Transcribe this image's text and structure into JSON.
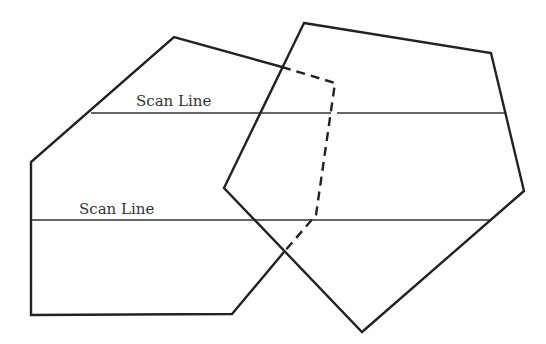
{
  "diagram": {
    "type": "scan-line polygon visibility",
    "labels": {
      "upper_scan_line": "Scan Line",
      "lower_scan_line": "Scan Line"
    },
    "colors": {
      "stroke": "#222222",
      "scan_line": "#333333",
      "background": "#ffffff"
    },
    "polygons": {
      "left_polygon": {
        "visible_vertices": [
          [
            282,
            67
          ],
          [
            174,
            37
          ],
          [
            31,
            162
          ],
          [
            31,
            315
          ],
          [
            232,
            314
          ],
          [
            284,
            252
          ]
        ],
        "hidden_vertices": [
          [
            282,
            67
          ],
          [
            335,
            83
          ],
          [
            316,
            215
          ],
          [
            284,
            252
          ]
        ]
      },
      "right_polygon": {
        "vertices": [
          [
            304,
            23
          ],
          [
            491,
            53
          ],
          [
            524,
            191
          ],
          [
            362,
            332
          ],
          [
            224,
            188
          ]
        ]
      }
    },
    "scan_lines": [
      {
        "name": "upper",
        "y": 113,
        "x_start": 91,
        "x_end": 505,
        "gap": [
          331,
          337
        ]
      },
      {
        "name": "lower",
        "y": 220,
        "x_start": 31,
        "x_end": 492
      }
    ]
  }
}
